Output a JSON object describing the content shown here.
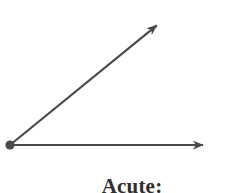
{
  "figure": {
    "background_color": "#ffffff",
    "stroke_color": "#4a4a4a",
    "vertex_color": "#4a4a4a",
    "stroke_width": 2.2,
    "caption": "Acute:",
    "caption_color": "#2f2f2f"
  },
  "geometry": {
    "vertex": {
      "x": 10,
      "y": 145,
      "radius": 4.6,
      "label": "angle-vertex"
    },
    "rays": [
      {
        "name": "horizontal-ray",
        "from_x": 10,
        "from_y": 145,
        "to_x": 207,
        "to_y": 145,
        "has_arrowhead": true,
        "direction_degrees": 0
      },
      {
        "name": "diagonal-ray",
        "from_x": 10,
        "from_y": 145,
        "to_x": 160,
        "to_y": 22,
        "has_arrowhead": true,
        "direction_degrees": 39
      }
    ],
    "angle_measure_degrees": 39,
    "angle_type": "acute"
  }
}
